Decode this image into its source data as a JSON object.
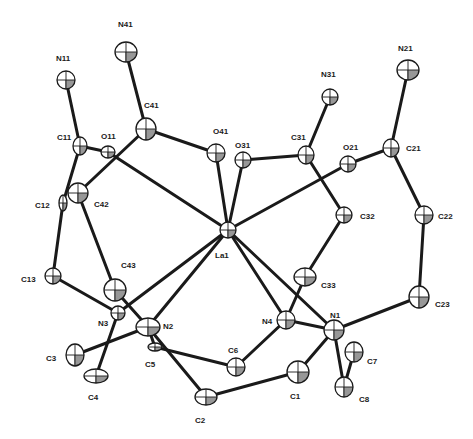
{
  "diagram": {
    "type": "ORTEP crystal structure",
    "central_atom": "La1",
    "colors": {
      "ink": "#1a1a1a",
      "background": "#ffffff"
    }
  },
  "atoms": [
    {
      "id": "N41",
      "x": 126,
      "y": 52,
      "rx": 11,
      "ry": 10,
      "lx": 118,
      "ly": 27
    },
    {
      "id": "N11",
      "x": 66,
      "y": 80,
      "rx": 9,
      "ry": 9,
      "lx": 56,
      "ly": 61
    },
    {
      "id": "C41",
      "x": 146,
      "y": 129,
      "rx": 10,
      "ry": 11,
      "lx": 144,
      "ly": 108
    },
    {
      "id": "C11",
      "x": 80,
      "y": 146,
      "rx": 7,
      "ry": 9,
      "lx": 57,
      "ly": 140
    },
    {
      "id": "O11",
      "x": 108,
      "y": 152,
      "rx": 7,
      "ry": 6,
      "lx": 101,
      "ly": 139
    },
    {
      "id": "O41",
      "x": 216,
      "y": 153,
      "rx": 9,
      "ry": 9,
      "lx": 213,
      "ly": 134
    },
    {
      "id": "O31",
      "x": 243,
      "y": 160,
      "rx": 8,
      "ry": 8,
      "lx": 235,
      "ly": 148
    },
    {
      "id": "C31",
      "x": 306,
      "y": 155,
      "rx": 8,
      "ry": 9,
      "lx": 291,
      "ly": 140
    },
    {
      "id": "N31",
      "x": 330,
      "y": 97,
      "rx": 8,
      "ry": 8,
      "lx": 321,
      "ly": 77
    },
    {
      "id": "O21",
      "x": 348,
      "y": 164,
      "rx": 8,
      "ry": 8,
      "lx": 343,
      "ly": 150
    },
    {
      "id": "C21",
      "x": 391,
      "y": 148,
      "rx": 8,
      "ry": 9,
      "lx": 406,
      "ly": 151
    },
    {
      "id": "N21",
      "x": 408,
      "y": 70,
      "rx": 11,
      "ry": 10,
      "lx": 398,
      "ly": 51
    },
    {
      "id": "C42",
      "x": 78,
      "y": 193,
      "rx": 10,
      "ry": 10,
      "lx": 94,
      "ly": 207
    },
    {
      "id": "C12",
      "x": 63,
      "y": 203,
      "rx": 4,
      "ry": 8,
      "lx": 35,
      "ly": 208
    },
    {
      "id": "C32",
      "x": 344,
      "y": 215,
      "rx": 8,
      "ry": 8,
      "lx": 360,
      "ly": 219
    },
    {
      "id": "C22",
      "x": 424,
      "y": 215,
      "rx": 9,
      "ry": 9,
      "lx": 438,
      "ly": 219
    },
    {
      "id": "La1",
      "x": 228,
      "y": 230,
      "rx": 8,
      "ry": 8,
      "lx": 215,
      "ly": 258
    },
    {
      "id": "C13",
      "x": 53,
      "y": 276,
      "rx": 8,
      "ry": 8,
      "lx": 21,
      "ly": 282
    },
    {
      "id": "C43",
      "x": 115,
      "y": 290,
      "rx": 11,
      "ry": 11,
      "lx": 121,
      "ly": 268
    },
    {
      "id": "N3",
      "x": 118,
      "y": 313,
      "rx": 7,
      "ry": 7,
      "lx": 98,
      "ly": 326
    },
    {
      "id": "N2",
      "x": 148,
      "y": 327,
      "rx": 12,
      "ry": 9,
      "lx": 163,
      "ly": 329
    },
    {
      "id": "C5",
      "x": 155,
      "y": 347,
      "rx": 7,
      "ry": 4,
      "lx": 145,
      "ly": 367
    },
    {
      "id": "C3",
      "x": 75,
      "y": 355,
      "rx": 9,
      "ry": 11,
      "lx": 46,
      "ly": 361
    },
    {
      "id": "C4",
      "x": 96,
      "y": 376,
      "rx": 12,
      "ry": 7,
      "lx": 88,
      "ly": 400
    },
    {
      "id": "C6",
      "x": 236,
      "y": 367,
      "rx": 9,
      "ry": 9,
      "lx": 228,
      "ly": 353
    },
    {
      "id": "C2",
      "x": 206,
      "y": 397,
      "rx": 11,
      "ry": 8,
      "lx": 195,
      "ly": 423
    },
    {
      "id": "C33",
      "x": 305,
      "y": 277,
      "rx": 11,
      "ry": 9,
      "lx": 321,
      "ly": 288
    },
    {
      "id": "N4",
      "x": 286,
      "y": 320,
      "rx": 9,
      "ry": 9,
      "lx": 262,
      "ly": 324
    },
    {
      "id": "N1",
      "x": 334,
      "y": 330,
      "rx": 10,
      "ry": 10,
      "lx": 330,
      "ly": 318
    },
    {
      "id": "C23",
      "x": 419,
      "y": 297,
      "rx": 10,
      "ry": 11,
      "lx": 435,
      "ly": 307
    },
    {
      "id": "C7",
      "x": 354,
      "y": 352,
      "rx": 9,
      "ry": 10,
      "lx": 367,
      "ly": 364
    },
    {
      "id": "C1",
      "x": 298,
      "y": 372,
      "rx": 11,
      "ry": 11,
      "lx": 290,
      "ly": 399
    },
    {
      "id": "C8",
      "x": 344,
      "y": 387,
      "rx": 9,
      "ry": 10,
      "lx": 359,
      "ly": 402
    }
  ],
  "bonds": [
    [
      "N41",
      "C41"
    ],
    [
      "N11",
      "C11"
    ],
    [
      "C41",
      "O41"
    ],
    [
      "C41",
      "C42"
    ],
    [
      "C11",
      "O11"
    ],
    [
      "C11",
      "C12"
    ],
    [
      "O11",
      "La1"
    ],
    [
      "O41",
      "La1"
    ],
    [
      "O31",
      "La1"
    ],
    [
      "O21",
      "La1"
    ],
    [
      "O31",
      "C31"
    ],
    [
      "C31",
      "N31"
    ],
    [
      "C31",
      "C32"
    ],
    [
      "O21",
      "C21"
    ],
    [
      "C21",
      "N21"
    ],
    [
      "C21",
      "C22"
    ],
    [
      "C22",
      "C23"
    ],
    [
      "C23",
      "N1"
    ],
    [
      "C32",
      "C33"
    ],
    [
      "C33",
      "N4"
    ],
    [
      "C42",
      "C43"
    ],
    [
      "C12",
      "C13"
    ],
    [
      "C13",
      "N3"
    ],
    [
      "C43",
      "N2"
    ],
    [
      "N3",
      "C4"
    ],
    [
      "N2",
      "C3"
    ],
    [
      "N2",
      "C5"
    ],
    [
      "C5",
      "C6"
    ],
    [
      "C6",
      "N4"
    ],
    [
      "N2",
      "C2"
    ],
    [
      "C2",
      "C1"
    ],
    [
      "C1",
      "N1"
    ],
    [
      "N4",
      "N1"
    ],
    [
      "N1",
      "C8"
    ],
    [
      "C8",
      "C7"
    ],
    [
      "La1",
      "N1"
    ],
    [
      "La1",
      "N4"
    ],
    [
      "La1",
      "N2"
    ],
    [
      "La1",
      "N3"
    ]
  ]
}
